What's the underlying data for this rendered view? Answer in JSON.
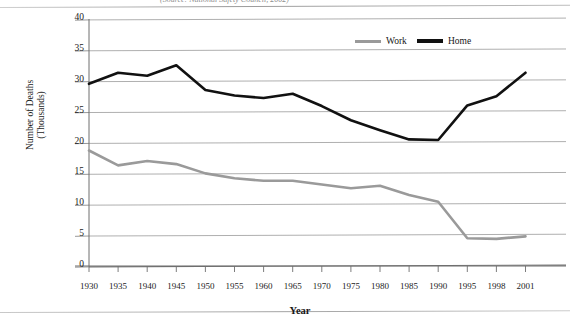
{
  "page": {
    "cropped_title": "(Source: National Safety Council, 2002)"
  },
  "axis_titles": {
    "x": "Year",
    "y_line1": "Number of Deaths",
    "y_line2": "(Thousands)"
  },
  "legend": {
    "position": "top-right",
    "entries": [
      {
        "label": "Work",
        "color": "#9a9a9a"
      },
      {
        "label": "Home",
        "color": "#111111"
      }
    ]
  },
  "chart_data": {
    "type": "line",
    "title": "",
    "subtitle": "",
    "xlabel": "Year",
    "ylabel": "Number of Deaths (Thousands)",
    "grid": true,
    "legend_position": "top-right",
    "xlim": [
      0,
      15
    ],
    "ylim": [
      0,
      40
    ],
    "yticks": [
      0,
      5,
      10,
      15,
      20,
      25,
      30,
      35,
      40
    ],
    "categories": [
      "1930",
      "1935",
      "1940",
      "1945",
      "1950",
      "1955",
      "1960",
      "1965",
      "1970",
      "1975",
      "1980",
      "1985",
      "1990",
      "1995",
      "1998",
      "2001"
    ],
    "series": [
      {
        "name": "Work",
        "color": "#9a9a9a",
        "values": [
          18.7,
          16.3,
          17.0,
          16.5,
          15.0,
          14.2,
          13.8,
          13.8,
          13.2,
          12.6,
          13.0,
          11.5,
          10.4,
          4.5,
          4.4,
          4.8
        ]
      },
      {
        "name": "Home",
        "color": "#111111",
        "values": [
          29.5,
          31.3,
          30.8,
          32.5,
          28.5,
          27.6,
          27.2,
          27.9,
          25.9,
          23.6,
          22.0,
          20.5,
          20.4,
          26.0,
          27.5,
          31.3
        ]
      }
    ]
  }
}
